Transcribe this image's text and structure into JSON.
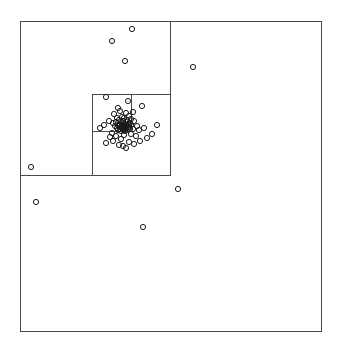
{
  "figure": {
    "title": "",
    "background_color": "#ffffff",
    "width": 339,
    "height": 347
  },
  "chart_data": {
    "type": "scatter",
    "title": "",
    "subtitle": "",
    "xlabel": "",
    "ylabel": "",
    "xlim": [
      20,
      321
    ],
    "ylim": [
      21,
      331
    ],
    "grid": false,
    "legend": null,
    "axes_visible": false,
    "tick_labels_x": [],
    "tick_labels_y": [],
    "marker": {
      "shape": "circle-open",
      "radius": 2.6,
      "stroke_color": "#1a1a1a",
      "stroke_width": 1.0,
      "fill": "none"
    },
    "box_style": {
      "stroke_color": "#4a4a4a",
      "stroke_width": 1.0,
      "fill": "none"
    },
    "boxes": [
      {
        "id": "root",
        "level": 0,
        "x0": 20,
        "y0": 21,
        "x1": 321,
        "y1": 331
      },
      {
        "id": "l1-nw",
        "level": 1,
        "x0": 20,
        "y0": 21,
        "x1": 170,
        "y1": 175
      },
      {
        "id": "l2-se-of-nw",
        "level": 2,
        "x0": 92,
        "y0": 94,
        "x1": 170,
        "y1": 175
      },
      {
        "id": "l3-split-v",
        "level": 3,
        "x0": 131,
        "y0": 94,
        "x1": 131,
        "y1": 131
      },
      {
        "id": "l3-split-h",
        "level": 3,
        "x0": 92,
        "y0": 131,
        "x1": 131,
        "y1": 131
      }
    ],
    "points": [
      [
        132,
        29
      ],
      [
        112,
        41
      ],
      [
        125,
        61
      ],
      [
        193,
        67
      ],
      [
        106,
        97
      ],
      [
        128,
        101
      ],
      [
        142,
        106
      ],
      [
        118,
        108
      ],
      [
        120,
        111
      ],
      [
        133,
        112
      ],
      [
        126,
        113
      ],
      [
        114,
        114
      ],
      [
        129,
        116
      ],
      [
        122,
        117
      ],
      [
        117,
        118
      ],
      [
        124,
        118
      ],
      [
        131,
        119
      ],
      [
        119,
        120
      ],
      [
        127,
        120
      ],
      [
        109,
        121
      ],
      [
        123,
        121
      ],
      [
        134,
        121
      ],
      [
        116,
        122
      ],
      [
        121,
        122
      ],
      [
        126,
        122
      ],
      [
        130,
        123
      ],
      [
        113,
        123
      ],
      [
        120,
        124
      ],
      [
        124,
        124
      ],
      [
        128,
        124
      ],
      [
        118,
        125
      ],
      [
        122,
        125
      ],
      [
        126,
        125
      ],
      [
        131,
        125
      ],
      [
        115,
        126
      ],
      [
        119,
        126
      ],
      [
        123,
        126
      ],
      [
        127,
        126
      ],
      [
        121,
        127
      ],
      [
        125,
        127
      ],
      [
        129,
        127
      ],
      [
        117,
        128
      ],
      [
        122,
        128
      ],
      [
        126,
        128
      ],
      [
        120,
        129
      ],
      [
        124,
        129
      ],
      [
        130,
        129
      ],
      [
        118,
        130
      ],
      [
        123,
        130
      ],
      [
        127,
        130
      ],
      [
        121,
        131
      ],
      [
        125,
        131
      ],
      [
        133,
        129
      ],
      [
        137,
        126
      ],
      [
        139,
        130
      ],
      [
        144,
        128
      ],
      [
        157,
        125
      ],
      [
        104,
        125
      ],
      [
        100,
        128
      ],
      [
        112,
        133
      ],
      [
        116,
        136
      ],
      [
        124,
        135
      ],
      [
        131,
        134
      ],
      [
        136,
        136
      ],
      [
        121,
        139
      ],
      [
        113,
        141
      ],
      [
        106,
        143
      ],
      [
        119,
        145
      ],
      [
        123,
        146
      ],
      [
        129,
        142
      ],
      [
        134,
        144
      ],
      [
        140,
        141
      ],
      [
        147,
        138
      ],
      [
        152,
        134
      ],
      [
        110,
        137
      ],
      [
        126,
        148
      ],
      [
        31,
        167
      ],
      [
        36,
        202
      ],
      [
        178,
        189
      ],
      [
        143,
        227
      ]
    ]
  }
}
